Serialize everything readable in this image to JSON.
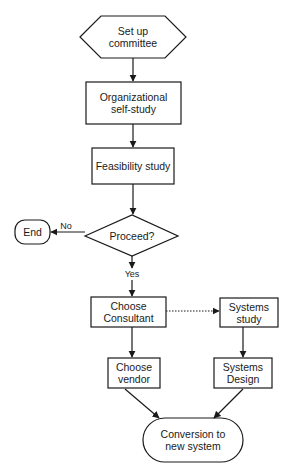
{
  "diagram": {
    "type": "flowchart",
    "colors": {
      "stroke": "#1a1a1a",
      "fill": "#ffffff",
      "text": "#1a1a1a"
    },
    "nodes": {
      "setup": {
        "shape": "hexagon",
        "label": "Set up\ncommittee"
      },
      "selfstudy": {
        "shape": "rectangle",
        "label": "Organizational\nself-study"
      },
      "feasibility": {
        "shape": "rectangle",
        "label": "Feasibility study"
      },
      "proceed": {
        "shape": "diamond",
        "label": "Proceed?"
      },
      "end": {
        "shape": "terminator",
        "label": "End"
      },
      "consultant": {
        "shape": "rectangle",
        "label": "Choose\nConsultant"
      },
      "systems_study": {
        "shape": "rectangle",
        "label": "Systems\nstudy"
      },
      "vendor": {
        "shape": "rectangle",
        "label": "Choose\nvendor"
      },
      "systems_design": {
        "shape": "rectangle",
        "label": "Systems\nDesign"
      },
      "conversion": {
        "shape": "terminator",
        "label": "Conversion to\nnew system"
      }
    },
    "edges": [
      {
        "from": "setup",
        "to": "selfstudy",
        "style": "solid",
        "label": ""
      },
      {
        "from": "selfstudy",
        "to": "feasibility",
        "style": "solid",
        "label": ""
      },
      {
        "from": "feasibility",
        "to": "proceed",
        "style": "solid",
        "label": ""
      },
      {
        "from": "proceed",
        "to": "end",
        "style": "solid",
        "label": "No"
      },
      {
        "from": "proceed",
        "to": "consultant",
        "style": "solid",
        "label": "Yes"
      },
      {
        "from": "consultant",
        "to": "systems_study",
        "style": "dotted",
        "label": ""
      },
      {
        "from": "consultant",
        "to": "vendor",
        "style": "solid",
        "label": ""
      },
      {
        "from": "systems_study",
        "to": "systems_design",
        "style": "solid",
        "label": ""
      },
      {
        "from": "vendor",
        "to": "conversion",
        "style": "solid",
        "label": ""
      },
      {
        "from": "systems_design",
        "to": "conversion",
        "style": "solid",
        "label": ""
      }
    ],
    "edge_labels": {
      "no": "No",
      "yes": "Yes"
    }
  }
}
